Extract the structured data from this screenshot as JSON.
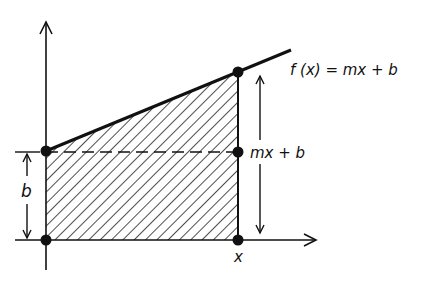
{
  "labels": {
    "function": "f (x) = mx + b",
    "height": "mx + b",
    "intercept": "b",
    "x_point": "x"
  },
  "colors": {
    "ink": "#111111",
    "background": "#ffffff"
  },
  "geometry": {
    "origin": [
      46,
      240
    ],
    "intercept_point": [
      46,
      151
    ],
    "top_point": [
      238,
      72
    ],
    "mid_point": [
      238,
      152
    ],
    "x_point": [
      238,
      240
    ]
  }
}
